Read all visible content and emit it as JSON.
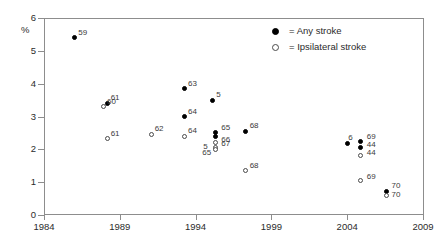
{
  "chart_data": {
    "type": "scatter",
    "title": "",
    "xlabel": "",
    "ylabel": "%",
    "xlim": [
      1984,
      2009
    ],
    "ylim": [
      0,
      6
    ],
    "xticks": [
      "1984",
      "1989",
      "1994",
      "1999",
      "2004",
      "2009"
    ],
    "yticks": [
      "0",
      "1",
      "2",
      "3",
      "4",
      "5",
      "6"
    ],
    "grid": false,
    "legend_position": "top-right",
    "series": [
      {
        "name": "Any stroke",
        "marker": "filled-circle",
        "color": "#000000",
        "points": [
          {
            "x": 1986.0,
            "y": 5.4,
            "label": "59",
            "lx": 4,
            "ly": -9
          },
          {
            "x": 1988.2,
            "y": 3.4,
            "label": "61",
            "lx": 3,
            "ly": -9
          },
          {
            "x": 1993.3,
            "y": 3.85,
            "label": "63",
            "lx": 3,
            "ly": -9
          },
          {
            "x": 1993.3,
            "y": 3.0,
            "label": "64",
            "lx": 3,
            "ly": -9
          },
          {
            "x": 1995.1,
            "y": 3.5,
            "label": "5",
            "lx": 4,
            "ly": -9
          },
          {
            "x": 1995.3,
            "y": 2.52,
            "label": "65",
            "lx": 6,
            "ly": -8
          },
          {
            "x": 1995.3,
            "y": 2.38,
            "label": "66",
            "lx": 6,
            "ly": -1
          },
          {
            "x": 1997.3,
            "y": 2.55,
            "label": "68",
            "lx": 4,
            "ly": -9
          },
          {
            "x": 2004.0,
            "y": 2.18,
            "label": "6",
            "lx": 1,
            "ly": -9
          },
          {
            "x": 2004.9,
            "y": 2.25,
            "label": "69",
            "lx": 6,
            "ly": -8
          },
          {
            "x": 2004.9,
            "y": 2.05,
            "label": "44",
            "lx": 6,
            "ly": -7
          },
          {
            "x": 2006.6,
            "y": 0.72,
            "label": "70",
            "lx": 5,
            "ly": -9
          }
        ]
      },
      {
        "name": "Ipsilateral stroke",
        "marker": "open-circle",
        "color": "#4a4a4a",
        "points": [
          {
            "x": 1987.9,
            "y": 3.3,
            "label": "60",
            "lx": 4,
            "ly": -9
          },
          {
            "x": 1988.2,
            "y": 2.32,
            "label": "61",
            "lx": 3,
            "ly": -9
          },
          {
            "x": 1991.1,
            "y": 2.46,
            "label": "62",
            "lx": 3,
            "ly": -9
          },
          {
            "x": 1993.3,
            "y": 2.4,
            "label": "64",
            "lx": 3,
            "ly": -9
          },
          {
            "x": 1995.3,
            "y": 2.22,
            "label": "67",
            "lx": 6,
            "ly": -2
          },
          {
            "x": 1995.3,
            "y": 2.06,
            "label": "5",
            "lx": -12,
            "ly": -4
          },
          {
            "x": 1995.3,
            "y": 2.0,
            "label": "65",
            "lx": -13,
            "ly": 0
          },
          {
            "x": 1997.3,
            "y": 1.35,
            "label": "68",
            "lx": 4,
            "ly": -9
          },
          {
            "x": 2004.9,
            "y": 1.8,
            "label": "44",
            "lx": 6,
            "ly": -7
          },
          {
            "x": 2004.9,
            "y": 1.05,
            "label": "69",
            "lx": 6,
            "ly": -8
          },
          {
            "x": 2006.6,
            "y": 0.6,
            "label": "70",
            "lx": 5,
            "ly": -4
          }
        ]
      }
    ]
  },
  "legend": {
    "items": [
      {
        "marker": "filled-circle",
        "text": "= Any stroke"
      },
      {
        "marker": "open-circle",
        "text": "= Ipsilateral stroke"
      }
    ]
  },
  "axis": {
    "y_unit_label": "%"
  }
}
